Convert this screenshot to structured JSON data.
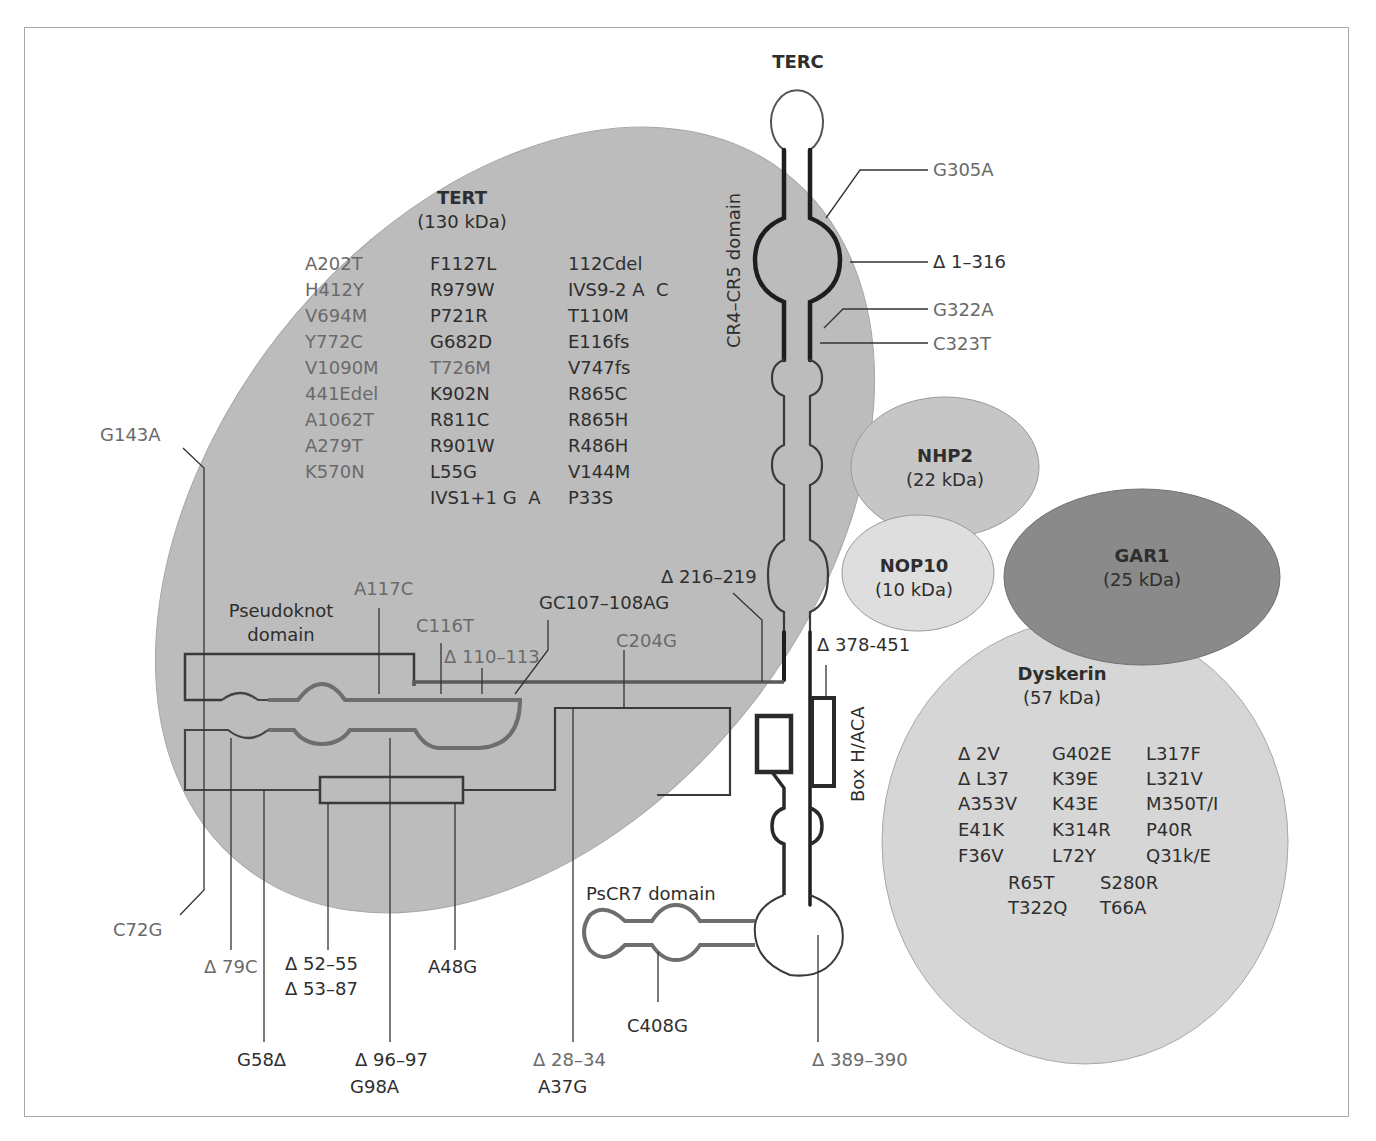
{
  "figure": {
    "title": "TERC",
    "colors": {
      "tert_fill": "#bcbcbc",
      "nhp2_fill": "#c6c6c6",
      "nop10_fill": "#dedede",
      "gar1_fill": "#8a8a8a",
      "dyskerin_fill": "#d6d6d6",
      "rna_dark": "#222222",
      "rna_gray": "#6e6e6e",
      "frame": "#a8a8a8"
    }
  },
  "proteins": {
    "tert": {
      "name": "TERT",
      "mass": "(130 kDa)",
      "mutations_col1": [
        "A202T",
        "H412Y",
        "V694M",
        "Y772C",
        "V1090M",
        "441Edel",
        "A1062T",
        "A279T",
        "K570N"
      ],
      "mutations_col2": [
        "F1127L",
        "R979W",
        "P721R",
        "G682D",
        "T726M",
        "K902N",
        "R811C",
        "R901W",
        "L55G",
        "IVS1+1 G  A"
      ],
      "mutations_col3": [
        "112Cdel",
        "IVS9-2 A  C",
        "T110M",
        "E116fs",
        "V747fs",
        "R865C",
        "R865H",
        "R486H",
        "V144M",
        "P33S"
      ]
    },
    "nhp2": {
      "name": "NHP2",
      "mass": "(22 kDa)"
    },
    "nop10": {
      "name": "NOP10",
      "mass": "(10 kDa)"
    },
    "gar1": {
      "name": "GAR1",
      "mass": "(25 kDa)"
    },
    "dyskerin": {
      "name": "Dyskerin",
      "mass": "(57 kDa)",
      "mutations_col1": [
        "Δ 2V",
        "Δ L37",
        "A353V",
        "E41K",
        "F36V"
      ],
      "mutations_col2": [
        "G402E",
        "K39E",
        "K43E",
        "K314R",
        "L72Y"
      ],
      "mutations_col3": [
        "L317F",
        "L321V",
        "M350T/I",
        "P40R",
        "Q31k/E"
      ],
      "mutations_row6": [
        "R65T",
        "S280R"
      ],
      "mutations_row7": [
        "T322Q",
        "T66A"
      ]
    }
  },
  "domains": {
    "cr4_cr5": "CR4–CR5 domain",
    "pseudoknot_line1": "Pseudoknot",
    "pseudoknot_line2": "domain",
    "box_haca": "Box H/ACA",
    "pscr7": "PsCR7 domain"
  },
  "terc_mutations": {
    "g305a": "G305A",
    "d1_316": "Δ 1–316",
    "g322a": "G322A",
    "c323t": "C323T",
    "g143a": "G143A",
    "a117c": "A117C",
    "c116t": "C116T",
    "d110_113": "Δ 110–113",
    "gc107_108ag": "GC107–108AG",
    "d216_219": "Δ 216–219",
    "c204g": "C204G",
    "d378_451": "Δ 378-451",
    "c72g": "C72G",
    "d79c": "Δ 79C",
    "d52_55": "Δ 52–55",
    "d53_87": "Δ 53–87",
    "a48g": "A48G",
    "g58d": "G58Δ",
    "d96_97": "Δ 96–97",
    "g98a": "G98A",
    "d28_34": "Δ 28–34",
    "a37g": "A37G",
    "c408g": "C408G",
    "d389_390": "Δ 389–390"
  }
}
